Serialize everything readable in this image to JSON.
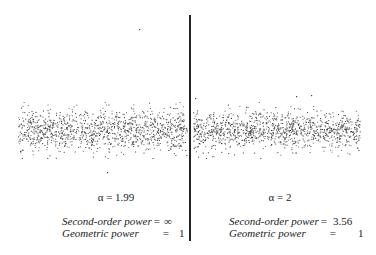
{
  "chart_data": {
    "type": "scatter",
    "title": "",
    "panels": [
      {
        "name": "left",
        "alpha_label": "α = 1.99",
        "alpha": 1.99,
        "stats": [
          {
            "label": "Second-order power",
            "value": "∞"
          },
          {
            "label": "Geometric power",
            "value": "1"
          }
        ],
        "description": "Impulsive noise samples centered around zero with occasional large outliers",
        "x_range_px": [
          18,
          187
        ],
        "band_center_px": 130,
        "band_halfwidth_px": 14,
        "outliers_px": [
          [
            139,
            29
          ],
          [
            107,
            172
          ]
        ]
      },
      {
        "name": "right",
        "alpha_label": "α = 2",
        "alpha": 2,
        "stats": [
          {
            "label": "Second-order power",
            "value": "3.56"
          },
          {
            "label": "Geometric power",
            "value": "1"
          }
        ],
        "description": "Gaussian noise samples centered around zero",
        "x_range_px": [
          193,
          360
        ],
        "band_center_px": 130,
        "band_halfwidth_px": 12,
        "outliers_px": [
          [
            296,
            96
          ],
          [
            311,
            95
          ],
          [
            195,
            98
          ]
        ]
      }
    ],
    "xlabel": "",
    "ylabel": "",
    "grid": false
  },
  "left": {
    "alpha_label": "α = 1.99",
    "second_order_label": "Second-order power",
    "second_order_value": "∞",
    "geometric_label": "Geometric power",
    "geometric_value": "1"
  },
  "right": {
    "alpha_label": "α = 2",
    "second_order_label": "Second-order power",
    "second_order_value": "3.56",
    "geometric_label": "Geometric power",
    "geometric_value": "1"
  },
  "equals": "="
}
